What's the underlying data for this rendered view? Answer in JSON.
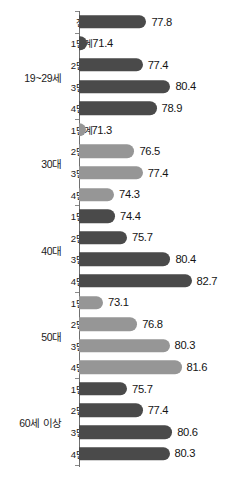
{
  "chart_data": {
    "type": "bar",
    "orientation": "horizontal",
    "title": "",
    "subtitle": "",
    "xlabel": "",
    "ylabel": "",
    "grid": false,
    "legend": false,
    "xlim": [
      70.5,
      83.5
    ],
    "value_suffix": "",
    "colors": {
      "dark": "#4a4a4a",
      "light": "#969696",
      "axis": "#6f6f6f",
      "text": "#1b1b1b",
      "background": "#ffffff"
    },
    "groups": [
      {
        "group_label": "",
        "shade": "light",
        "items": [
          {
            "category": "전체",
            "value": 77.8,
            "value_label": "77.8",
            "shade": "dark"
          }
        ]
      },
      {
        "group_label": "19~29세",
        "shade": "dark",
        "items": [
          {
            "category": "1단계",
            "value": 71.4,
            "value_label": "71.4",
            "shade": "dark"
          },
          {
            "category": "2단계",
            "value": 77.4,
            "value_label": "77.4",
            "shade": "dark"
          },
          {
            "category": "3단계",
            "value": 80.4,
            "value_label": "80.4",
            "shade": "dark"
          },
          {
            "category": "4단계",
            "value": 78.9,
            "value_label": "78.9",
            "shade": "dark"
          }
        ]
      },
      {
        "group_label": "30대",
        "shade": "light",
        "items": [
          {
            "category": "1단계",
            "value": 71.3,
            "value_label": "71.3",
            "shade": "light"
          },
          {
            "category": "2단계",
            "value": 76.5,
            "value_label": "76.5",
            "shade": "light"
          },
          {
            "category": "3단계",
            "value": 77.4,
            "value_label": "77.4",
            "shade": "light"
          },
          {
            "category": "4단계",
            "value": 74.3,
            "value_label": "74.3",
            "shade": "light"
          }
        ]
      },
      {
        "group_label": "40대",
        "shade": "dark",
        "items": [
          {
            "category": "1단계",
            "value": 74.4,
            "value_label": "74.4",
            "shade": "dark"
          },
          {
            "category": "2단계",
            "value": 75.7,
            "value_label": "75.7",
            "shade": "dark"
          },
          {
            "category": "3단계",
            "value": 80.4,
            "value_label": "80.4",
            "shade": "dark"
          },
          {
            "category": "4단계",
            "value": 82.7,
            "value_label": "82.7",
            "shade": "dark"
          }
        ]
      },
      {
        "group_label": "50대",
        "shade": "light",
        "items": [
          {
            "category": "1단계",
            "value": 73.1,
            "value_label": "73.1",
            "shade": "light"
          },
          {
            "category": "2단계",
            "value": 76.8,
            "value_label": "76.8",
            "shade": "light"
          },
          {
            "category": "3단계",
            "value": 80.3,
            "value_label": "80.3",
            "shade": "light"
          },
          {
            "category": "4단계",
            "value": 81.6,
            "value_label": "81.6",
            "shade": "light"
          }
        ]
      },
      {
        "group_label": "60세 이상",
        "shade": "dark",
        "items": [
          {
            "category": "1단계",
            "value": 75.7,
            "value_label": "75.7",
            "shade": "dark"
          },
          {
            "category": "2단계",
            "value": 77.4,
            "value_label": "77.4",
            "shade": "dark"
          },
          {
            "category": "3단계",
            "value": 80.6,
            "value_label": "80.6",
            "shade": "dark"
          },
          {
            "category": "4단계",
            "value": 80.3,
            "value_label": "80.3",
            "shade": "dark"
          }
        ]
      }
    ]
  }
}
